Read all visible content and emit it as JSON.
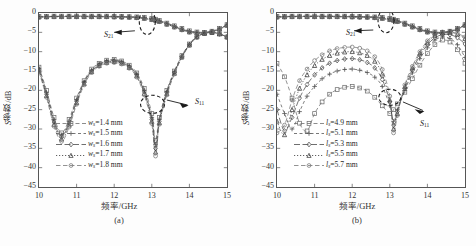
{
  "figure": {
    "panels": [
      {
        "id": "a",
        "caption": "(a)",
        "xlabel_cn": "频率",
        "xlabel_unit": "/GHz",
        "ylabel_cn": "参数",
        "ylabel_unit": "/dB",
        "ylabel_sym": "S",
        "annotations": [
          {
            "name": "s21-label",
            "text": "S",
            "sub": "21"
          },
          {
            "name": "s11-label",
            "text": "S",
            "sub": "11"
          }
        ],
        "legend": [
          {
            "sym": "w",
            "sub": "s",
            "value": "=1.4 mm",
            "marker": "square",
            "dash": "4,3"
          },
          {
            "sym": "w",
            "sub": "s",
            "value": "=1.5 mm",
            "marker": "plus",
            "dash": "3,3"
          },
          {
            "sym": "w",
            "sub": "s",
            "value": "=1.6 mm",
            "marker": "diamond",
            "dash": "7,3"
          },
          {
            "sym": "w",
            "sub": "s",
            "value": "=1.7 mm",
            "marker": "triangle",
            "dash": "1.5,2"
          },
          {
            "sym": "w",
            "sub": "s",
            "value": "=1.8 mm",
            "marker": "circle",
            "dash": "5,3"
          }
        ]
      },
      {
        "id": "b",
        "caption": "(b)",
        "xlabel_cn": "频率",
        "xlabel_unit": "/GHz",
        "ylabel_cn": "参数",
        "ylabel_unit": "/dB",
        "ylabel_sym": "S",
        "annotations": [
          {
            "name": "s21-label",
            "text": "S",
            "sub": "21"
          },
          {
            "name": "s11-label",
            "text": "S",
            "sub": "11"
          }
        ],
        "legend": [
          {
            "sym": "l",
            "sub": "s",
            "value": "=4.9 mm",
            "marker": "square",
            "dash": "4,3"
          },
          {
            "sym": "l",
            "sub": "s",
            "value": "=5.1 mm",
            "marker": "plus",
            "dash": "3,3"
          },
          {
            "sym": "l",
            "sub": "s",
            "value": "=5.3 mm",
            "marker": "diamond",
            "dash": "7,3"
          },
          {
            "sym": "l",
            "sub": "s",
            "value": "=5.5 mm",
            "marker": "triangle",
            "dash": "1.5,2"
          },
          {
            "sym": "l",
            "sub": "s",
            "value": "=5.7 mm",
            "marker": "circle",
            "dash": "5,3"
          }
        ]
      }
    ]
  },
  "chart_data": [
    {
      "type": "line",
      "panel": "(a)",
      "title": "",
      "xlabel": "频率/GHz",
      "ylabel": "S参数/dB",
      "xlim": [
        10,
        15
      ],
      "ylim": [
        -45,
        0
      ],
      "xticks": [
        10,
        11,
        12,
        13,
        14,
        15
      ],
      "yticks": [
        0,
        -5,
        -10,
        -15,
        -20,
        -25,
        -30,
        -35,
        -40,
        -45
      ],
      "grid": false,
      "legend_position": "lower-left-inside",
      "x": [
        10.0,
        10.2,
        10.4,
        10.6,
        10.8,
        11.0,
        11.2,
        11.4,
        11.6,
        11.8,
        12.0,
        12.2,
        12.4,
        12.6,
        12.8,
        13.0,
        13.1,
        13.2,
        13.4,
        13.6,
        13.8,
        14.0,
        14.2,
        14.4,
        14.6,
        14.8,
        15.0
      ],
      "series": [
        {
          "name": "S11, w_s=1.4 mm",
          "param": "S11",
          "marker": "square",
          "values": [
            -14.0,
            -20.0,
            -27.0,
            -31.0,
            -27.5,
            -22.0,
            -17.5,
            -14.5,
            -13.0,
            -12.2,
            -12.0,
            -12.4,
            -13.5,
            -15.5,
            -19.5,
            -26.0,
            -33.0,
            -27.0,
            -20.0,
            -15.0,
            -11.0,
            -8.0,
            -6.0,
            -5.1,
            -5.0,
            -5.4,
            -6.2
          ]
        },
        {
          "name": "S11, w_s=1.5 mm",
          "param": "S11",
          "marker": "plus",
          "values": [
            -14.3,
            -20.5,
            -27.6,
            -31.5,
            -28.0,
            -22.4,
            -17.8,
            -14.8,
            -13.2,
            -12.4,
            -12.2,
            -12.6,
            -13.7,
            -15.8,
            -20.0,
            -27.0,
            -34.0,
            -27.5,
            -20.3,
            -15.2,
            -11.2,
            -8.1,
            -6.1,
            -5.2,
            -5.0,
            -5.4,
            -6.2
          ]
        },
        {
          "name": "S11, w_s=1.6 mm",
          "param": "S11",
          "marker": "diamond",
          "values": [
            -14.6,
            -21.0,
            -28.2,
            -32.0,
            -28.5,
            -22.8,
            -18.0,
            -15.0,
            -13.4,
            -12.6,
            -12.4,
            -12.8,
            -13.9,
            -16.0,
            -20.4,
            -27.5,
            -35.0,
            -28.0,
            -20.6,
            -15.4,
            -11.3,
            -8.2,
            -6.2,
            -5.2,
            -5.0,
            -5.4,
            -6.2
          ]
        },
        {
          "name": "S11, w_s=1.7 mm",
          "param": "S11",
          "marker": "triangle",
          "values": [
            -14.9,
            -21.4,
            -28.8,
            -32.6,
            -29.0,
            -23.2,
            -18.3,
            -15.2,
            -13.6,
            -12.8,
            -12.6,
            -13.0,
            -14.1,
            -16.3,
            -20.8,
            -28.0,
            -36.0,
            -28.4,
            -20.9,
            -15.6,
            -11.4,
            -8.3,
            -6.2,
            -5.3,
            -5.0,
            -5.4,
            -6.2
          ]
        },
        {
          "name": "S11, w_s=1.8 mm",
          "param": "S11",
          "marker": "circle",
          "values": [
            -15.2,
            -21.8,
            -29.3,
            -33.2,
            -29.5,
            -23.6,
            -18.6,
            -15.4,
            -13.8,
            -13.0,
            -12.8,
            -13.2,
            -14.3,
            -16.6,
            -21.2,
            -28.6,
            -37.0,
            -28.8,
            -21.2,
            -15.8,
            -11.5,
            -8.4,
            -6.3,
            -5.3,
            -5.0,
            -5.4,
            -6.2
          ]
        },
        {
          "name": "S21, w_s=1.4 mm",
          "param": "S21",
          "marker": "square",
          "values": [
            -0.9,
            -0.85,
            -0.8,
            -0.8,
            -0.8,
            -0.8,
            -0.8,
            -0.8,
            -0.8,
            -0.8,
            -0.85,
            -0.9,
            -0.95,
            -1.0,
            -1.1,
            -1.4,
            -1.6,
            -1.9,
            -2.6,
            -3.3,
            -4.0,
            -4.6,
            -4.9,
            -5.0,
            -4.7,
            -4.0,
            -3.0
          ]
        },
        {
          "name": "S21, w_s=1.5 mm",
          "param": "S21",
          "marker": "plus",
          "values": [
            -0.95,
            -0.9,
            -0.85,
            -0.85,
            -0.85,
            -0.85,
            -0.85,
            -0.85,
            -0.85,
            -0.85,
            -0.9,
            -0.95,
            -1.0,
            -1.1,
            -1.2,
            -1.5,
            -1.7,
            -2.0,
            -2.7,
            -3.4,
            -4.1,
            -4.7,
            -5.0,
            -5.1,
            -4.8,
            -4.1,
            -3.1
          ]
        },
        {
          "name": "S21, w_s=1.6 mm",
          "param": "S21",
          "marker": "diamond",
          "values": [
            -1.0,
            -0.95,
            -0.9,
            -0.9,
            -0.9,
            -0.9,
            -0.9,
            -0.9,
            -0.9,
            -0.9,
            -0.95,
            -1.0,
            -1.05,
            -1.15,
            -1.3,
            -1.6,
            -1.8,
            -2.1,
            -2.8,
            -3.5,
            -4.2,
            -4.8,
            -5.1,
            -5.1,
            -4.8,
            -4.1,
            -3.1
          ]
        },
        {
          "name": "S21, w_s=1.7 mm",
          "param": "S21",
          "marker": "triangle",
          "values": [
            -1.05,
            -1.0,
            -0.95,
            -0.95,
            -0.95,
            -0.95,
            -0.95,
            -0.95,
            -0.95,
            -0.95,
            -1.0,
            -1.05,
            -1.1,
            -1.2,
            -1.4,
            -1.7,
            -1.9,
            -2.2,
            -2.9,
            -3.6,
            -4.3,
            -4.9,
            -5.2,
            -5.2,
            -4.9,
            -4.2,
            -3.2
          ]
        },
        {
          "name": "S21, w_s=1.8 mm",
          "param": "S21",
          "marker": "circle",
          "values": [
            -1.1,
            -1.05,
            -1.0,
            -1.0,
            -1.0,
            -1.0,
            -1.0,
            -1.0,
            -1.0,
            -1.0,
            -1.05,
            -1.1,
            -1.15,
            -1.25,
            -1.45,
            -1.75,
            -1.95,
            -2.25,
            -3.0,
            -3.7,
            -4.4,
            -5.0,
            -5.2,
            -5.2,
            -4.9,
            -4.2,
            -3.2
          ]
        }
      ]
    },
    {
      "type": "line",
      "panel": "(b)",
      "title": "",
      "xlabel": "频率/GHz",
      "ylabel": "S参数/dB",
      "xlim": [
        10,
        15
      ],
      "ylim": [
        -45,
        0
      ],
      "xticks": [
        10,
        11,
        12,
        13,
        14,
        15
      ],
      "yticks": [
        0,
        -5,
        -10,
        -15,
        -20,
        -25,
        -30,
        -35,
        -40,
        -45
      ],
      "grid": false,
      "legend_position": "lower-left-inside",
      "x": [
        10.0,
        10.2,
        10.4,
        10.6,
        10.8,
        11.0,
        11.2,
        11.4,
        11.6,
        11.8,
        12.0,
        12.2,
        12.4,
        12.6,
        12.8,
        13.0,
        13.1,
        13.2,
        13.4,
        13.6,
        13.8,
        14.0,
        14.2,
        14.4,
        14.6,
        14.8,
        15.0
      ],
      "series": [
        {
          "name": "S11, l_s=4.9 mm",
          "param": "S11",
          "marker": "square",
          "values": [
            -13.0,
            -16.5,
            -22.0,
            -28.5,
            -30.5,
            -26.0,
            -23.0,
            -21.0,
            -19.8,
            -19.2,
            -19.0,
            -19.4,
            -20.2,
            -21.8,
            -24.0,
            -26.0,
            -25.0,
            -23.5,
            -20.5,
            -17.0,
            -13.5,
            -10.5,
            -8.2,
            -7.0,
            -7.5,
            -9.5,
            -13.0
          ]
        },
        {
          "name": "S11, l_s=5.1 mm",
          "param": "S11",
          "marker": "plus",
          "values": [
            -21.0,
            -26.0,
            -30.0,
            -25.5,
            -21.5,
            -19.0,
            -17.0,
            -15.8,
            -15.0,
            -14.6,
            -14.5,
            -14.8,
            -15.4,
            -16.6,
            -19.0,
            -24.0,
            -28.0,
            -25.0,
            -20.0,
            -15.5,
            -11.8,
            -9.0,
            -7.0,
            -6.2,
            -6.6,
            -8.2,
            -11.5
          ]
        },
        {
          "name": "S11, l_s=5.3 mm",
          "param": "S11",
          "marker": "diamond",
          "values": [
            -25.0,
            -30.5,
            -27.0,
            -22.0,
            -18.5,
            -16.0,
            -14.2,
            -13.0,
            -12.3,
            -11.9,
            -11.8,
            -12.1,
            -12.8,
            -14.2,
            -17.2,
            -23.0,
            -29.0,
            -25.5,
            -19.5,
            -14.8,
            -11.0,
            -8.2,
            -6.4,
            -5.6,
            -5.6,
            -6.4,
            -8.0
          ]
        },
        {
          "name": "S11, l_s=5.5 mm",
          "param": "S11",
          "marker": "triangle",
          "values": [
            -28.0,
            -31.5,
            -25.0,
            -19.5,
            -16.0,
            -13.6,
            -12.0,
            -11.0,
            -10.4,
            -10.1,
            -10.0,
            -10.3,
            -11.0,
            -12.5,
            -15.8,
            -22.5,
            -30.0,
            -26.0,
            -19.0,
            -14.2,
            -10.4,
            -7.6,
            -5.8,
            -5.1,
            -5.0,
            -5.5,
            -6.6
          ]
        },
        {
          "name": "S11, l_s=5.7 mm",
          "param": "S11",
          "marker": "circle",
          "values": [
            -31.0,
            -29.0,
            -22.5,
            -17.5,
            -14.5,
            -12.3,
            -10.8,
            -9.8,
            -9.2,
            -8.9,
            -8.8,
            -9.1,
            -9.8,
            -11.3,
            -14.6,
            -21.5,
            -31.0,
            -26.5,
            -18.6,
            -13.8,
            -10.0,
            -7.2,
            -5.5,
            -4.9,
            -4.9,
            -5.3,
            -6.2
          ]
        },
        {
          "name": "S21, l_s=4.9 mm",
          "param": "S21",
          "marker": "square",
          "values": [
            -0.9,
            -0.85,
            -0.8,
            -0.8,
            -0.8,
            -0.8,
            -0.8,
            -0.8,
            -0.8,
            -0.8,
            -0.85,
            -0.9,
            -0.95,
            -1.0,
            -1.1,
            -1.4,
            -1.6,
            -1.9,
            -2.6,
            -3.3,
            -4.0,
            -4.6,
            -4.9,
            -5.0,
            -4.7,
            -4.0,
            -3.0
          ]
        },
        {
          "name": "S21, l_s=5.1 mm",
          "param": "S21",
          "marker": "plus",
          "values": [
            -0.95,
            -0.9,
            -0.85,
            -0.85,
            -0.85,
            -0.85,
            -0.85,
            -0.85,
            -0.85,
            -0.85,
            -0.9,
            -0.95,
            -1.0,
            -1.1,
            -1.2,
            -1.5,
            -1.7,
            -2.0,
            -2.7,
            -3.4,
            -4.1,
            -4.7,
            -5.0,
            -5.1,
            -4.8,
            -4.1,
            -3.1
          ]
        },
        {
          "name": "S21, l_s=5.3 mm",
          "param": "S21",
          "marker": "diamond",
          "values": [
            -1.0,
            -0.95,
            -0.9,
            -0.9,
            -0.9,
            -0.9,
            -0.9,
            -0.9,
            -0.9,
            -0.9,
            -0.95,
            -1.0,
            -1.05,
            -1.15,
            -1.3,
            -1.6,
            -1.8,
            -2.1,
            -2.8,
            -3.5,
            -4.2,
            -4.8,
            -5.1,
            -5.1,
            -4.8,
            -4.1,
            -3.1
          ]
        },
        {
          "name": "S21, l_s=5.5 mm",
          "param": "S21",
          "marker": "triangle",
          "values": [
            -1.05,
            -1.0,
            -0.95,
            -0.95,
            -0.95,
            -0.95,
            -0.95,
            -0.95,
            -0.95,
            -0.95,
            -1.0,
            -1.05,
            -1.1,
            -1.2,
            -1.4,
            -1.7,
            -1.9,
            -2.2,
            -2.9,
            -3.6,
            -4.3,
            -4.9,
            -5.2,
            -5.2,
            -4.9,
            -4.2,
            -3.2
          ]
        },
        {
          "name": "S21, l_s=5.7 mm",
          "param": "S21",
          "marker": "circle",
          "values": [
            -1.1,
            -1.05,
            -1.0,
            -1.0,
            -1.0,
            -1.0,
            -1.0,
            -1.0,
            -1.0,
            -1.0,
            -1.05,
            -1.1,
            -1.15,
            -1.25,
            -1.45,
            -1.75,
            -1.95,
            -2.25,
            -3.0,
            -3.7,
            -4.4,
            -5.0,
            -5.2,
            -5.2,
            -4.9,
            -4.2,
            -3.2
          ]
        }
      ]
    }
  ]
}
